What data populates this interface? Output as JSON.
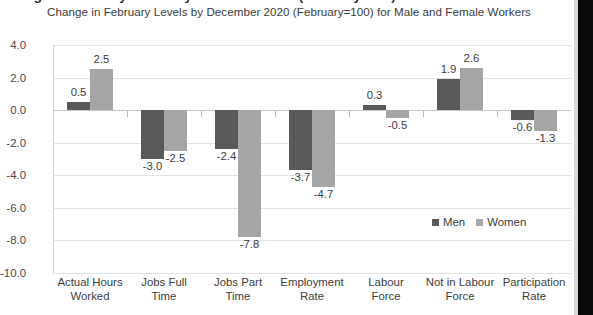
{
  "chart_data": {
    "type": "bar",
    "title": "Change in February Levels by December 2020 (February=100) for Male and Female Workers",
    "subtitle": "Change in February Levels by December 2020 (February=100) for Male and Female Workers",
    "xlabel": "",
    "ylabel": "",
    "ylim": [
      -10.0,
      4.0
    ],
    "ytick_step": 2.0,
    "yticks": [
      "4.0",
      "2.0",
      "0.0",
      "-2.0",
      "-4.0",
      "-6.0",
      "-8.0",
      "-10.0"
    ],
    "ytick_values": [
      4.0,
      2.0,
      0.0,
      -2.0,
      -4.0,
      -6.0,
      -8.0,
      -10.0
    ],
    "grid": true,
    "legend_position": "inside-lower-right",
    "categories": [
      "Actual Hours Worked",
      "Jobs Full Time",
      "Jobs Part Time",
      "Employment Rate",
      "Labour Force",
      "Not in Labour Force",
      "Participation Rate"
    ],
    "category_lines": [
      [
        "Actual Hours",
        "Worked"
      ],
      [
        "Jobs Full",
        "Time"
      ],
      [
        "Jobs Part",
        "Time"
      ],
      [
        "Employment",
        "Rate"
      ],
      [
        "Labour",
        "Force"
      ],
      [
        "Not in Labour",
        "Force"
      ],
      [
        "Participation",
        "Rate"
      ]
    ],
    "series": [
      {
        "name": "Men",
        "color": "#595959",
        "values": [
          0.5,
          -3.0,
          -2.4,
          -3.7,
          0.3,
          1.9,
          -0.6
        ],
        "labels": [
          "0.5",
          "-3.0",
          "-2.4",
          "-3.7",
          "0.3",
          "1.9",
          "-0.6"
        ]
      },
      {
        "name": "Women",
        "color": "#a6a6a6",
        "values": [
          2.5,
          -2.5,
          -7.8,
          -4.7,
          -0.5,
          2.6,
          -1.3
        ],
        "labels": [
          "2.5",
          "-2.5",
          "-7.8",
          "-4.7",
          "-0.5",
          "2.6",
          "-1.3"
        ]
      }
    ]
  },
  "legend": {
    "items": [
      {
        "label": "Men",
        "color": "#595959"
      },
      {
        "label": "Women",
        "color": "#a6a6a6"
      }
    ]
  },
  "colors": {
    "men": "#595959",
    "women": "#a6a6a6",
    "grid": "#e3e3e3",
    "text": "#3d3d3d",
    "axis": "#c9c9c9"
  }
}
